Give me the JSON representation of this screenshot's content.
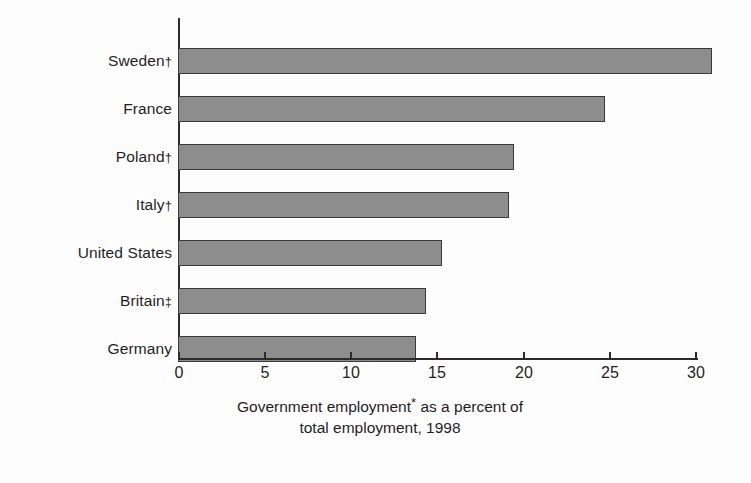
{
  "chart_data": {
    "type": "bar",
    "orientation": "horizontal",
    "title": "",
    "categories": [
      "Sweden†",
      "France",
      "Poland†",
      "Italy†",
      "United States",
      "Britain‡",
      "Germany"
    ],
    "values": [
      31.0,
      24.8,
      19.5,
      19.2,
      15.3,
      14.4,
      13.8
    ],
    "series": [
      {
        "name": "Government employment as a percent of total employment, 1998",
        "values": [
          31.0,
          24.8,
          19.5,
          19.2,
          15.3,
          14.4,
          13.8
        ]
      }
    ],
    "xlabel": "Government employment* as a percent of total employment, 1998",
    "ylabel": "",
    "xlim": [
      0,
      30
    ],
    "xticks": [
      0,
      5,
      10,
      15,
      20,
      25,
      30
    ],
    "xtick_labels": [
      "0",
      "5",
      "10",
      "15",
      "20",
      "25",
      "30"
    ],
    "grid": false,
    "legend": false,
    "bar_color": "#8d8d8d",
    "bar_edge_color": "#3a3a3a",
    "axis_color": "#2b2b2b",
    "background_color": "#fdfdfd"
  },
  "caption": {
    "line1_before": "Government employment",
    "line1_marker": "*",
    "line1_after": " as a percent of",
    "line2": "total employment, 1998"
  },
  "axis": {
    "tick_labels": [
      "0",
      "5",
      "10",
      "15",
      "20",
      "25",
      "30"
    ]
  },
  "bars": [
    {
      "label": "Sweden",
      "marker": "†",
      "value": 31.0
    },
    {
      "label": "France",
      "marker": "",
      "value": 24.8
    },
    {
      "label": "Poland",
      "marker": "†",
      "value": 19.5
    },
    {
      "label": "Italy",
      "marker": "†",
      "value": 19.2
    },
    {
      "label": "United States",
      "marker": "",
      "value": 15.3
    },
    {
      "label": "Britain",
      "marker": "‡",
      "value": 14.4
    },
    {
      "label": "Germany",
      "marker": "",
      "value": 13.8
    }
  ]
}
